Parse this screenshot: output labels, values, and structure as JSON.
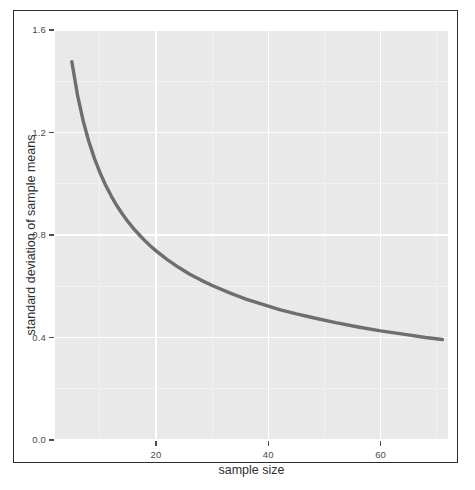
{
  "chart_data": {
    "type": "line",
    "title": "",
    "xlabel": "sample size",
    "ylabel": "standard deviation of sample means",
    "xlim": [
      2,
      72
    ],
    "ylim": [
      0.0,
      1.6
    ],
    "grid": true,
    "legend": null,
    "xticks": [
      20,
      40,
      60
    ],
    "xtick_labels": [
      "20",
      "40",
      "60"
    ],
    "yticks": [
      0.0,
      0.4,
      0.8,
      1.2,
      1.6
    ],
    "ytick_labels": [
      "0.0",
      "0.4",
      "0.8",
      "1.2",
      "1.6"
    ],
    "x_minor_ticks": [
      10,
      30,
      50,
      70
    ],
    "y_minor_ticks": [
      0.2,
      0.6,
      1.0,
      1.4
    ],
    "series": [
      {
        "name": "standard error",
        "color": "#6e6e6e",
        "line_width": 3.4,
        "x": [
          5,
          6,
          7,
          8,
          9,
          10,
          11,
          12,
          13,
          14,
          15,
          16,
          17,
          18,
          19,
          20,
          22,
          24,
          26,
          28,
          30,
          33,
          36,
          39,
          42,
          45,
          48,
          52,
          56,
          60,
          64,
          68,
          71
        ],
        "y": [
          1.476,
          1.347,
          1.247,
          1.167,
          1.1,
          1.044,
          0.995,
          0.953,
          0.915,
          0.882,
          0.852,
          0.825,
          0.801,
          0.778,
          0.757,
          0.738,
          0.704,
          0.674,
          0.647,
          0.624,
          0.603,
          0.575,
          0.55,
          0.529,
          0.509,
          0.492,
          0.477,
          0.458,
          0.441,
          0.426,
          0.413,
          0.4,
          0.392
        ]
      }
    ]
  },
  "panel": {
    "background_color": "#e9e9e9",
    "gridline_color": "#ffffff",
    "minor_gridline_color": "#f2f2f2"
  },
  "frame": {
    "border_color": "#2b2b2b",
    "background_color": "#ffffff"
  }
}
